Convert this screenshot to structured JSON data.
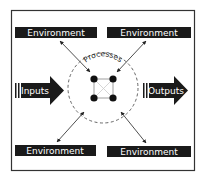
{
  "diagram": {
    "center_label": "Processes",
    "input_label": "Inputs",
    "output_label": "Outputs",
    "environment": [
      {
        "label": "Environment",
        "position": "top-left"
      },
      {
        "label": "Environment",
        "position": "top-right"
      },
      {
        "label": "Environment",
        "position": "bottom-left"
      },
      {
        "label": "Environment",
        "position": "bottom-right"
      }
    ],
    "colors": {
      "box_fill": "#1a1a1a",
      "text": "#ffffff",
      "border": "#333333",
      "circle": "#555555",
      "node": "#111111",
      "node_lines": "#999999",
      "cross_lines": "#cccccc"
    }
  }
}
